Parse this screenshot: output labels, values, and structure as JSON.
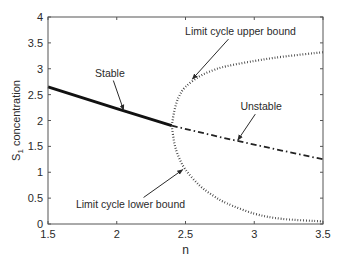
{
  "chart_data": {
    "type": "line",
    "title": "",
    "xlabel": "n",
    "ylabel": "S1 concentration",
    "ylabel_main": "S",
    "ylabel_sub": "1",
    "ylabel_rest": " concentration",
    "xlim": [
      1.5,
      3.5
    ],
    "ylim": [
      0,
      4
    ],
    "grid": false,
    "xticks": [
      1.5,
      2,
      2.5,
      3,
      3.5
    ],
    "xtick_labels": [
      "1.5",
      "2",
      "2.5",
      "3",
      "3.5"
    ],
    "yticks": [
      0,
      0.5,
      1,
      1.5,
      2,
      2.5,
      3,
      3.5,
      4
    ],
    "ytick_labels": [
      "0",
      "0.5",
      "1",
      "1.5",
      "2",
      "2.5",
      "3",
      "3.5",
      "4"
    ],
    "bifurcation_point": {
      "n": 2.4,
      "s1": 1.9
    },
    "series": [
      {
        "name": "Stable",
        "style": "solid-thick",
        "x": [
          1.5,
          2.0,
          2.4
        ],
        "y": [
          2.65,
          2.23,
          1.9
        ]
      },
      {
        "name": "Unstable",
        "style": "dash-dot",
        "x": [
          2.4,
          2.8,
          3.2,
          3.5
        ],
        "y": [
          1.9,
          1.65,
          1.42,
          1.25
        ]
      },
      {
        "name": "Limit cycle upper bound",
        "style": "dotted",
        "x": [
          2.4,
          2.42,
          2.45,
          2.5,
          2.6,
          2.7,
          2.8,
          3.0,
          3.2,
          3.5
        ],
        "y": [
          1.9,
          2.2,
          2.45,
          2.65,
          2.85,
          2.97,
          3.05,
          3.15,
          3.23,
          3.32
        ]
      },
      {
        "name": "Limit cycle lower bound",
        "style": "dotted",
        "x": [
          2.4,
          2.42,
          2.45,
          2.5,
          2.6,
          2.7,
          2.8,
          3.0,
          3.2,
          3.5
        ],
        "y": [
          1.9,
          1.55,
          1.3,
          1.05,
          0.75,
          0.55,
          0.4,
          0.2,
          0.1,
          0.05
        ]
      }
    ],
    "annotations": [
      {
        "text": "Stable",
        "text_pos": [
          1.95,
          2.85
        ],
        "arrow_to": [
          2.05,
          2.2
        ]
      },
      {
        "text": "Limit cycle upper bound",
        "text_pos": [
          2.9,
          3.65
        ],
        "arrow_to": [
          2.55,
          2.8
        ]
      },
      {
        "text": "Unstable",
        "text_pos": [
          3.05,
          2.2
        ],
        "arrow_to": [
          2.88,
          1.62
        ]
      },
      {
        "text": "Limit cycle lower bound",
        "text_pos": [
          2.1,
          0.3
        ],
        "arrow_to": [
          2.48,
          1.05
        ]
      }
    ]
  }
}
